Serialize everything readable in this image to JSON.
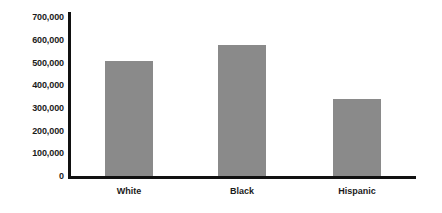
{
  "chart_data": {
    "type": "bar",
    "title": "",
    "subtitle": "",
    "xlabel": "",
    "ylabel": "",
    "categories": [
      "White",
      "Black",
      "Hispanic"
    ],
    "values": [
      508000,
      575000,
      339000
    ],
    "ylim": [
      0,
      700000
    ],
    "ytick_labels": [
      "700,000",
      "600,000",
      "500,000",
      "400,000",
      "300,000",
      "200,000",
      "100,000",
      "0"
    ],
    "ytick_values": [
      700000,
      600000,
      500000,
      400000,
      300000,
      200000,
      100000,
      0
    ],
    "grid": false,
    "legend": false,
    "legend_position": "none",
    "bar_color": "#8a8a8a",
    "axis_color": "#111111",
    "text_color": "#1b1b1b",
    "background_color": "#ffffff"
  },
  "axis": {
    "y_line_name": "y-axis-line",
    "x_line_name": "x-axis-line"
  }
}
